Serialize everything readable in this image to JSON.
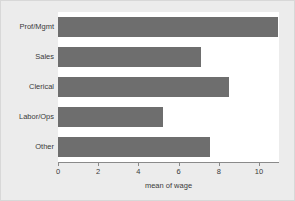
{
  "chart_data": {
    "type": "bar",
    "orientation": "horizontal",
    "title": "",
    "subtitle": "",
    "xlabel": "mean of wage",
    "ylabel": "",
    "categories": [
      "Prof/Mgmt",
      "Sales",
      "Clerical",
      "Labor/Ops",
      "Other"
    ],
    "values": [
      10.95,
      7.1,
      8.5,
      5.25,
      7.55
    ],
    "series": [
      {
        "name": "mean of wage",
        "values": [
          10.95,
          7.1,
          8.5,
          5.25,
          7.55
        ]
      }
    ],
    "xlim": [
      0,
      11.0
    ],
    "ylim": null,
    "xticks": [
      0,
      2,
      4,
      6,
      8,
      10
    ],
    "xtick_labels": [
      "0",
      "2",
      "4",
      "6",
      "8",
      "10"
    ],
    "grid": false,
    "legend": null,
    "legend_position": "none",
    "annotations": [],
    "bar_color": "#6e6e6e",
    "plot_background": "#ffffff",
    "figure_background": "#ececec",
    "axis_color": "#8a8a8a",
    "text_color": "#3a3a3a"
  }
}
